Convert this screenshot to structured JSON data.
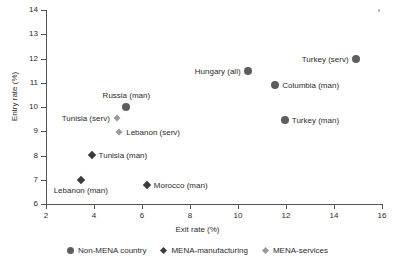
{
  "chart_data": {
    "type": "scatter",
    "title": "",
    "xlabel": "Exit rate (%)",
    "ylabel": "Entry rate (%)",
    "xlim": [
      2,
      16
    ],
    "ylim": [
      6,
      14
    ],
    "xticks": [
      2,
      4,
      6,
      8,
      10,
      12,
      14,
      16
    ],
    "yticks": [
      6,
      7,
      8,
      9,
      10,
      11,
      12,
      13,
      14
    ],
    "grid": false,
    "legend_position": "bottom",
    "series": [
      {
        "name": "Non-MENA country",
        "marker": "circle",
        "color": "#5e5e5e",
        "points": [
          {
            "label": "Russia (man)",
            "x": 5.35,
            "y": 10.0,
            "label_pos": "above"
          },
          {
            "label": "Hungary (all)",
            "x": 10.4,
            "y": 11.5,
            "label_pos": "left"
          },
          {
            "label": "Turkey (serv)",
            "x": 14.9,
            "y": 12.0,
            "label_pos": "left"
          },
          {
            "label": "Columbia (man)",
            "x": 11.55,
            "y": 10.9,
            "label_pos": "right"
          },
          {
            "label": "Turkey (man)",
            "x": 11.95,
            "y": 9.45,
            "label_pos": "right"
          }
        ]
      },
      {
        "name": "MENA-manufacturing",
        "marker": "diamond-dark",
        "color": "#3c3c3c",
        "points": [
          {
            "label": "Tunisia (man)",
            "x": 3.9,
            "y": 8.03,
            "label_pos": "right"
          },
          {
            "label": "Lebanon (man)",
            "x": 3.45,
            "y": 7.0,
            "label_pos": "below"
          },
          {
            "label": "Morocco (man)",
            "x": 6.2,
            "y": 6.8,
            "label_pos": "right"
          }
        ]
      },
      {
        "name": "MENA-services",
        "marker": "diamond-light",
        "color": "#9a9a9a",
        "points": [
          {
            "label": "Tunisia (serv)",
            "x": 4.95,
            "y": 9.56,
            "label_pos": "left"
          },
          {
            "label": "Lebanon (serv)",
            "x": 5.05,
            "y": 8.98,
            "label_pos": "right"
          }
        ]
      }
    ]
  },
  "legend": {
    "items": [
      {
        "label": "Non-MENA country",
        "marker": "circle"
      },
      {
        "label": "MENA-manufacturing",
        "marker": "diamond-dark"
      },
      {
        "label": "MENA-services",
        "marker": "diamond-light"
      }
    ]
  }
}
